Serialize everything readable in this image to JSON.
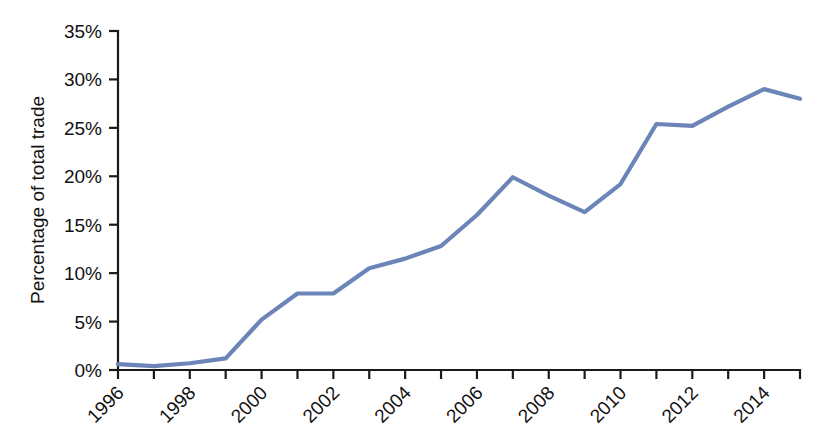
{
  "chart_data": {
    "type": "line",
    "title": "",
    "subtitle": "",
    "xlabel": "",
    "ylabel": "Percentage of total trade",
    "xlim": [
      1996,
      2015
    ],
    "ylim": [
      0,
      35
    ],
    "grid": false,
    "legend": false,
    "legend_position": "none",
    "line_color": "#6b85b8",
    "axis_color": "#1a1a1a",
    "background_color": "#ffffff",
    "x": [
      1996,
      1997,
      1998,
      1999,
      2000,
      2001,
      2002,
      2003,
      2004,
      2005,
      2006,
      2007,
      2008,
      2009,
      2010,
      2011,
      2012,
      2013,
      2014,
      2015
    ],
    "values": [
      0.6,
      0.4,
      0.7,
      1.2,
      5.2,
      7.9,
      7.9,
      10.5,
      11.5,
      12.8,
      16.0,
      19.9,
      18.0,
      16.3,
      19.2,
      25.4,
      25.2,
      27.2,
      29.0,
      28.0
    ],
    "series": [
      {
        "name": "Percentage of total trade",
        "color": "#6b85b8",
        "values": [
          0.6,
          0.4,
          0.7,
          1.2,
          5.2,
          7.9,
          7.9,
          10.5,
          11.5,
          12.8,
          16.0,
          19.9,
          18.0,
          16.3,
          19.2,
          25.4,
          25.2,
          27.2,
          29.0,
          28.0
        ]
      }
    ],
    "ytick_values": [
      0,
      5,
      10,
      15,
      20,
      25,
      30,
      35
    ],
    "ytick_labels": [
      "0%",
      "5%",
      "10%",
      "15%",
      "20%",
      "25%",
      "30%",
      "35%"
    ],
    "xtick_values": [
      1996,
      1997,
      1998,
      1999,
      2000,
      2001,
      2002,
      2003,
      2004,
      2005,
      2006,
      2007,
      2008,
      2009,
      2010,
      2011,
      2012,
      2013,
      2014,
      2015
    ],
    "xtick_labels": [
      "1996",
      "",
      "1998",
      "",
      "2000",
      "",
      "2002",
      "",
      "2004",
      "",
      "2006",
      "",
      "2008",
      "",
      "2010",
      "",
      "2012",
      "",
      "2014",
      ""
    ],
    "xtick_labels_shown": [
      "1996",
      "1998",
      "2000",
      "2002",
      "2004",
      "2006",
      "2008",
      "2010",
      "2012",
      "2014"
    ],
    "annotations": []
  }
}
